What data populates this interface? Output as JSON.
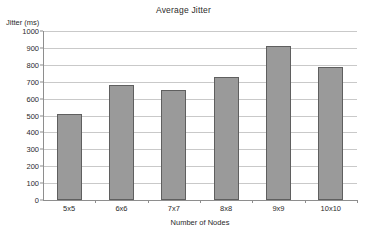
{
  "chart_data": {
    "type": "bar",
    "title": "Average Jitter",
    "xlabel": "Number of Nodes",
    "ylabel": "Jitter (ms)",
    "categories": [
      "5x5",
      "6x6",
      "7x7",
      "8x8",
      "9x9",
      "10x10"
    ],
    "values": [
      508,
      682,
      653,
      727,
      910,
      790
    ],
    "series": [
      {
        "name": "Average Jitter",
        "values": [
          508,
          682,
          653,
          727,
          910,
          790
        ]
      }
    ],
    "ylim": [
      0,
      1000
    ],
    "ytick_step": 100,
    "yticks": [
      0,
      100,
      200,
      300,
      400,
      500,
      600,
      700,
      800,
      900,
      1000
    ],
    "ytick_labels": [
      "0",
      "100",
      "200",
      "300",
      "400",
      "500",
      "600",
      "700",
      "800",
      "900",
      "1000"
    ],
    "grid": "horizontal",
    "legend": "none",
    "colors": {
      "bar_fill": "#9a9a9a",
      "bar_border": "#5f5f5f",
      "gridline": "#c9c9c9",
      "axis": "#8e8e8e",
      "text": "#2b2b2b",
      "background": "#ffffff"
    }
  }
}
